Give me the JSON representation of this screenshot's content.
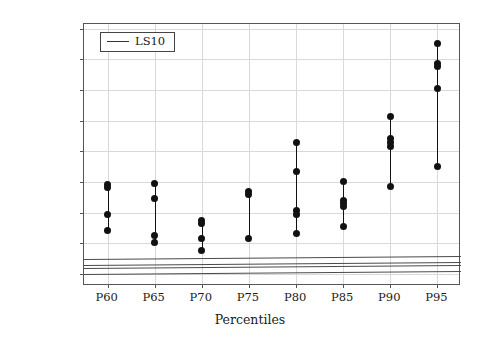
{
  "chart_data": {
    "type": "scatter",
    "title": "",
    "xlabel": "Percentiles",
    "ylabel": "Makespan",
    "categories": [
      "P60",
      "P65",
      "P70",
      "P75",
      "P80",
      "P85",
      "P90",
      "P95"
    ],
    "xtick_labels": [
      "P60",
      "P65",
      "P70",
      "P75",
      "P80",
      "P85",
      "P90",
      "P95"
    ],
    "ytick_labels": [
      "300",
      "320",
      "340",
      "360",
      "380",
      "400",
      "420",
      "440",
      "460"
    ],
    "yticks": [
      300,
      320,
      340,
      360,
      380,
      400,
      420,
      440,
      460
    ],
    "ylim": [
      292,
      463
    ],
    "grid": true,
    "legend": {
      "position": "top-left",
      "entries": [
        "LS10"
      ]
    },
    "series": [
      {
        "name": "LS10",
        "marker": "filled-circle",
        "color": "#111111",
        "groups": [
          {
            "category": "P60",
            "values": [
              358.5,
              356.0,
              339.0,
              328.0
            ],
            "range": [
              328.0,
              358.5
            ]
          },
          {
            "category": "P65",
            "values": [
              359.0,
              349.0,
              325.0,
              320.5
            ],
            "range": [
              320.5,
              359.0
            ]
          },
          {
            "category": "P70",
            "values": [
              335.0,
              333.0,
              323.0,
              315.0
            ],
            "range": [
              315.0,
              335.0
            ]
          },
          {
            "category": "P75",
            "values": [
              353.5,
              351.5,
              323.0
            ],
            "range": [
              323.0,
              353.5
            ]
          },
          {
            "category": "P80",
            "values": [
              385.5,
              367.0,
              341.5,
              339.0,
              326.0
            ],
            "range": [
              326.0,
              385.5
            ]
          },
          {
            "category": "P85",
            "values": [
              360.5,
              348.0,
              346.0,
              344.0,
              331.0
            ],
            "range": [
              331.0,
              360.5
            ]
          },
          {
            "category": "P90",
            "values": [
              402.5,
              388.0,
              385.5,
              383.0,
              357.0
            ],
            "range": [
              357.0,
              402.5
            ]
          },
          {
            "category": "P95",
            "values": [
              450.5,
              437.0,
              435.0,
              421.0,
              370.0
            ],
            "range": [
              370.0,
              450.5
            ]
          }
        ]
      }
    ],
    "reference_lines": [
      {
        "name": "ref-line-1",
        "y_start": 309.5,
        "y_end": 311.5,
        "color": "#4a4a4a"
      },
      {
        "name": "ref-line-2",
        "y_start": 305.5,
        "y_end": 307.5,
        "color": "#4a4a4a"
      },
      {
        "name": "ref-line-3",
        "y_start": 304.0,
        "y_end": 306.0,
        "color": "#4a4a4a"
      },
      {
        "name": "ref-line-4",
        "y_start": 300.0,
        "y_end": 302.0,
        "color": "#4a4a4a"
      }
    ]
  },
  "legend": {
    "label": "LS10"
  },
  "axes": {
    "y_title": "Makespan",
    "x_title": "Percentiles"
  }
}
